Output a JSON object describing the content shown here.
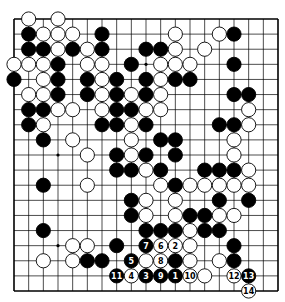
{
  "diagram": {
    "type": "go-board",
    "size": 19,
    "colors": {
      "board": "#ffffff",
      "line": "#000000",
      "black": "#000000",
      "white": "#ffffff"
    },
    "star_points": [
      [
        3,
        3
      ],
      [
        3,
        9
      ],
      [
        3,
        15
      ],
      [
        9,
        3
      ],
      [
        9,
        9
      ],
      [
        9,
        15
      ],
      [
        15,
        3
      ],
      [
        15,
        9
      ],
      [
        15,
        15
      ]
    ],
    "stones": [
      {
        "c": 1,
        "r": 0,
        "color": "W"
      },
      {
        "c": 3,
        "r": 0,
        "color": "W"
      },
      {
        "c": 1,
        "r": 1,
        "color": "B"
      },
      {
        "c": 2,
        "r": 1,
        "color": "W"
      },
      {
        "c": 3,
        "r": 1,
        "color": "W"
      },
      {
        "c": 4,
        "r": 1,
        "color": "W"
      },
      {
        "c": 6,
        "r": 1,
        "color": "B"
      },
      {
        "c": 11,
        "r": 1,
        "color": "W"
      },
      {
        "c": 14,
        "r": 1,
        "color": "W"
      },
      {
        "c": 15,
        "r": 1,
        "color": "B"
      },
      {
        "c": 1,
        "r": 2,
        "color": "B"
      },
      {
        "c": 2,
        "r": 2,
        "color": "B"
      },
      {
        "c": 3,
        "r": 2,
        "color": "W"
      },
      {
        "c": 4,
        "r": 2,
        "color": "B"
      },
      {
        "c": 5,
        "r": 2,
        "color": "W"
      },
      {
        "c": 6,
        "r": 2,
        "color": "B"
      },
      {
        "c": 9,
        "r": 2,
        "color": "B"
      },
      {
        "c": 10,
        "r": 2,
        "color": "B"
      },
      {
        "c": 11,
        "r": 2,
        "color": "W"
      },
      {
        "c": 13,
        "r": 2,
        "color": "W"
      },
      {
        "c": 0,
        "r": 3,
        "color": "W"
      },
      {
        "c": 1,
        "r": 3,
        "color": "W"
      },
      {
        "c": 2,
        "r": 3,
        "color": "W"
      },
      {
        "c": 3,
        "r": 3,
        "color": "B"
      },
      {
        "c": 5,
        "r": 3,
        "color": "W"
      },
      {
        "c": 6,
        "r": 3,
        "color": "W"
      },
      {
        "c": 8,
        "r": 3,
        "color": "B"
      },
      {
        "c": 10,
        "r": 3,
        "color": "W"
      },
      {
        "c": 11,
        "r": 3,
        "color": "W"
      },
      {
        "c": 12,
        "r": 3,
        "color": "W"
      },
      {
        "c": 15,
        "r": 3,
        "color": "B"
      },
      {
        "c": 0,
        "r": 4,
        "color": "B"
      },
      {
        "c": 2,
        "r": 4,
        "color": "W"
      },
      {
        "c": 3,
        "r": 4,
        "color": "B"
      },
      {
        "c": 5,
        "r": 4,
        "color": "B"
      },
      {
        "c": 6,
        "r": 4,
        "color": "W"
      },
      {
        "c": 7,
        "r": 4,
        "color": "B"
      },
      {
        "c": 9,
        "r": 4,
        "color": "B"
      },
      {
        "c": 10,
        "r": 4,
        "color": "W"
      },
      {
        "c": 11,
        "r": 4,
        "color": "B"
      },
      {
        "c": 12,
        "r": 4,
        "color": "B"
      },
      {
        "c": 1,
        "r": 5,
        "color": "W"
      },
      {
        "c": 2,
        "r": 5,
        "color": "W"
      },
      {
        "c": 3,
        "r": 5,
        "color": "B"
      },
      {
        "c": 5,
        "r": 5,
        "color": "B"
      },
      {
        "c": 6,
        "r": 5,
        "color": "W"
      },
      {
        "c": 7,
        "r": 5,
        "color": "B"
      },
      {
        "c": 8,
        "r": 5,
        "color": "W"
      },
      {
        "c": 9,
        "r": 5,
        "color": "B"
      },
      {
        "c": 10,
        "r": 5,
        "color": "W"
      },
      {
        "c": 15,
        "r": 5,
        "color": "B"
      },
      {
        "c": 16,
        "r": 5,
        "color": "B"
      },
      {
        "c": 1,
        "r": 6,
        "color": "B"
      },
      {
        "c": 2,
        "r": 6,
        "color": "B"
      },
      {
        "c": 3,
        "r": 6,
        "color": "W"
      },
      {
        "c": 4,
        "r": 6,
        "color": "W"
      },
      {
        "c": 6,
        "r": 6,
        "color": "W"
      },
      {
        "c": 7,
        "r": 6,
        "color": "B"
      },
      {
        "c": 8,
        "r": 6,
        "color": "B"
      },
      {
        "c": 9,
        "r": 6,
        "color": "W"
      },
      {
        "c": 10,
        "r": 6,
        "color": "W"
      },
      {
        "c": 16,
        "r": 6,
        "color": "W"
      },
      {
        "c": 1,
        "r": 7,
        "color": "B"
      },
      {
        "c": 2,
        "r": 7,
        "color": "W"
      },
      {
        "c": 6,
        "r": 7,
        "color": "B"
      },
      {
        "c": 7,
        "r": 7,
        "color": "B"
      },
      {
        "c": 8,
        "r": 7,
        "color": "W"
      },
      {
        "c": 9,
        "r": 7,
        "color": "B"
      },
      {
        "c": 14,
        "r": 7,
        "color": "B"
      },
      {
        "c": 15,
        "r": 7,
        "color": "B"
      },
      {
        "c": 16,
        "r": 7,
        "color": "W"
      },
      {
        "c": 2,
        "r": 8,
        "color": "B"
      },
      {
        "c": 4,
        "r": 8,
        "color": "W"
      },
      {
        "c": 8,
        "r": 8,
        "color": "W"
      },
      {
        "c": 10,
        "r": 8,
        "color": "B"
      },
      {
        "c": 11,
        "r": 8,
        "color": "B"
      },
      {
        "c": 15,
        "r": 8,
        "color": "W"
      },
      {
        "c": 5,
        "r": 9,
        "color": "W"
      },
      {
        "c": 7,
        "r": 9,
        "color": "B"
      },
      {
        "c": 8,
        "r": 9,
        "color": "W"
      },
      {
        "c": 9,
        "r": 9,
        "color": "B"
      },
      {
        "c": 11,
        "r": 9,
        "color": "B"
      },
      {
        "c": 15,
        "r": 9,
        "color": "W"
      },
      {
        "c": 7,
        "r": 10,
        "color": "B"
      },
      {
        "c": 8,
        "r": 10,
        "color": "B"
      },
      {
        "c": 9,
        "r": 10,
        "color": "W"
      },
      {
        "c": 10,
        "r": 10,
        "color": "B"
      },
      {
        "c": 13,
        "r": 10,
        "color": "B"
      },
      {
        "c": 14,
        "r": 10,
        "color": "B"
      },
      {
        "c": 15,
        "r": 10,
        "color": "B"
      },
      {
        "c": 16,
        "r": 10,
        "color": "W"
      },
      {
        "c": 2,
        "r": 11,
        "color": "B"
      },
      {
        "c": 5,
        "r": 11,
        "color": "W"
      },
      {
        "c": 10,
        "r": 11,
        "color": "W"
      },
      {
        "c": 11,
        "r": 11,
        "color": "B"
      },
      {
        "c": 12,
        "r": 11,
        "color": "W"
      },
      {
        "c": 13,
        "r": 11,
        "color": "W"
      },
      {
        "c": 14,
        "r": 11,
        "color": "W"
      },
      {
        "c": 15,
        "r": 11,
        "color": "W"
      },
      {
        "c": 16,
        "r": 11,
        "color": "W"
      },
      {
        "c": 8,
        "r": 12,
        "color": "B"
      },
      {
        "c": 9,
        "r": 12,
        "color": "W"
      },
      {
        "c": 11,
        "r": 12,
        "color": "W"
      },
      {
        "c": 14,
        "r": 12,
        "color": "B"
      },
      {
        "c": 16,
        "r": 12,
        "color": "B"
      },
      {
        "c": 8,
        "r": 13,
        "color": "B"
      },
      {
        "c": 9,
        "r": 13,
        "color": "W"
      },
      {
        "c": 11,
        "r": 13,
        "color": "W"
      },
      {
        "c": 12,
        "r": 13,
        "color": "B"
      },
      {
        "c": 13,
        "r": 13,
        "color": "B"
      },
      {
        "c": 14,
        "r": 13,
        "color": "W"
      },
      {
        "c": 15,
        "r": 13,
        "color": "W"
      },
      {
        "c": 2,
        "r": 14,
        "color": "B"
      },
      {
        "c": 9,
        "r": 14,
        "color": "B"
      },
      {
        "c": 10,
        "r": 14,
        "color": "B"
      },
      {
        "c": 11,
        "r": 14,
        "color": "B"
      },
      {
        "c": 12,
        "r": 14,
        "color": "W"
      },
      {
        "c": 13,
        "r": 14,
        "color": "B"
      },
      {
        "c": 14,
        "r": 14,
        "color": "B"
      },
      {
        "c": 4,
        "r": 15,
        "color": "W"
      },
      {
        "c": 5,
        "r": 15,
        "color": "W"
      },
      {
        "c": 7,
        "r": 15,
        "color": "B"
      },
      {
        "c": 9,
        "r": 15,
        "color": "B",
        "label": "7"
      },
      {
        "c": 10,
        "r": 15,
        "color": "W",
        "label": "6"
      },
      {
        "c": 11,
        "r": 15,
        "color": "W",
        "label": "2"
      },
      {
        "c": 12,
        "r": 15,
        "color": "W"
      },
      {
        "c": 15,
        "r": 15,
        "color": "B"
      },
      {
        "c": 2,
        "r": 16,
        "color": "W"
      },
      {
        "c": 4,
        "r": 16,
        "color": "W"
      },
      {
        "c": 5,
        "r": 16,
        "color": "B"
      },
      {
        "c": 6,
        "r": 16,
        "color": "B"
      },
      {
        "c": 8,
        "r": 16,
        "color": "B",
        "label": "5"
      },
      {
        "c": 9,
        "r": 16,
        "color": "W"
      },
      {
        "c": 10,
        "r": 16,
        "color": "W",
        "label": "8"
      },
      {
        "c": 11,
        "r": 16,
        "color": "B"
      },
      {
        "c": 12,
        "r": 16,
        "color": "W"
      },
      {
        "c": 14,
        "r": 16,
        "color": "W"
      },
      {
        "c": 15,
        "r": 16,
        "color": "B"
      },
      {
        "c": 7,
        "r": 17,
        "color": "B",
        "label": "11"
      },
      {
        "c": 8,
        "r": 17,
        "color": "W",
        "label": "4"
      },
      {
        "c": 9,
        "r": 17,
        "color": "B",
        "label": "3"
      },
      {
        "c": 10,
        "r": 17,
        "color": "B",
        "label": "9"
      },
      {
        "c": 11,
        "r": 17,
        "color": "B",
        "label": "1"
      },
      {
        "c": 12,
        "r": 17,
        "color": "W",
        "label": "10"
      },
      {
        "c": 13,
        "r": 17,
        "color": "W"
      },
      {
        "c": 15,
        "r": 17,
        "color": "W",
        "label": "12"
      },
      {
        "c": 16,
        "r": 17,
        "color": "B",
        "label": "13"
      },
      {
        "c": 16,
        "r": 18,
        "color": "W",
        "label": "14"
      }
    ]
  }
}
